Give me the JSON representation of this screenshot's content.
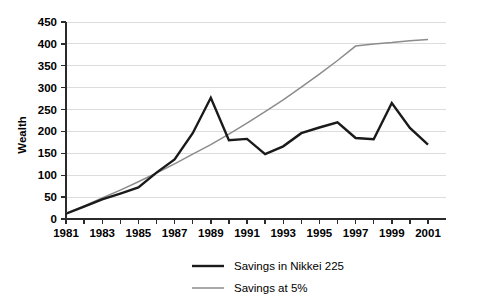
{
  "chart_data": {
    "type": "line",
    "title": "",
    "subtitle": "",
    "xlabel": "",
    "ylabel": "Wealth",
    "xlim": [
      1981,
      2001
    ],
    "ylim": [
      0,
      450
    ],
    "y_ticks": [
      0,
      50,
      100,
      150,
      200,
      250,
      300,
      350,
      400,
      450
    ],
    "x_ticks": [
      1981,
      1982,
      1983,
      1984,
      1985,
      1986,
      1987,
      1988,
      1989,
      1990,
      1991,
      1992,
      1993,
      1994,
      1995,
      1996,
      1997,
      1998,
      1999,
      2000,
      2001
    ],
    "x_tick_labels": [
      "1981",
      "",
      "1983",
      "",
      "1985",
      "",
      "1987",
      "",
      "1989",
      "",
      "1991",
      "",
      "1993",
      "",
      "1995",
      "",
      "1997",
      "",
      "1999",
      "",
      "2001"
    ],
    "grid": "horizontal",
    "legend_position": "bottom",
    "x": [
      1981,
      1982,
      1983,
      1984,
      1985,
      1986,
      1987,
      1988,
      1989,
      1990,
      1991,
      1992,
      1993,
      1994,
      1995,
      1996,
      1997,
      1998,
      1999,
      2000,
      2001
    ],
    "series": [
      {
        "name": "Savings in Nikkei 225",
        "color": "#1a1a1a",
        "width": 2.4,
        "values": [
          12,
          28,
          45,
          58,
          72,
          106,
          136,
          196,
          277,
          180,
          183,
          148,
          166,
          196,
          209,
          221,
          185,
          182,
          265,
          208,
          170
        ]
      },
      {
        "name": "Savings at 5%",
        "color": "#8c8c8c",
        "width": 1.5,
        "values": [
          13,
          30,
          48,
          66,
          85,
          105,
          126,
          148,
          170,
          194,
          219,
          245,
          272,
          301,
          331,
          362,
          395,
          400,
          403,
          407,
          410
        ]
      }
    ]
  },
  "legend": {
    "items": [
      {
        "label": "Savings in Nikkei 225",
        "color": "#1a1a1a"
      },
      {
        "label": "Savings at 5%",
        "color": "#8c8c8c"
      }
    ]
  },
  "style": {
    "background": "#ffffff",
    "gridline_color": "#dcdcdc",
    "axis_color": "#2b2b2b",
    "text_color": "#000000"
  }
}
